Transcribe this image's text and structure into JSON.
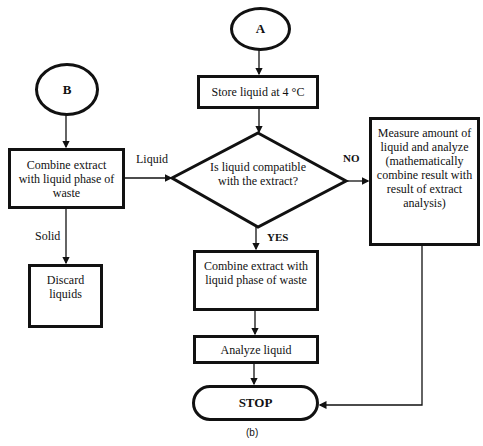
{
  "nodes": {
    "a": "A",
    "b": "B",
    "store": "Store liquid at 4 °C",
    "combine_left": "Combine extract with liquid phase of waste",
    "decision": "Is liquid compatible with the extract?",
    "measure": "Measure amount of liquid and analyze (mathematically combine result with result of extract analysis)",
    "discard": "Discard liquids",
    "combine_center": "Combine extract with liquid phase of waste",
    "analyze": "Analyze liquid",
    "stop": "STOP"
  },
  "edges": {
    "liquid": "Liquid",
    "solid": "Solid",
    "no": "NO",
    "yes": "YES"
  },
  "caption": "(b)"
}
